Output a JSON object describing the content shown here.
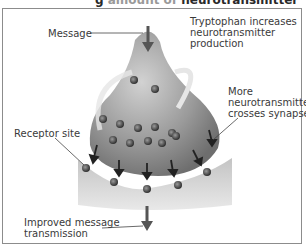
{
  "title": {
    "visible_part": "g",
    "faded_part": " amount of ",
    "bold_part": "neurotransmitter"
  },
  "labels": {
    "message": "Message",
    "tryptophan": [
      "Tryptophan increases",
      "neurotransmitter",
      "production"
    ],
    "more_nt": [
      "More",
      "neurotransmitter",
      "crosses synapse"
    ],
    "receptor": "Receptor site",
    "improved": [
      "Improved message",
      "transmission"
    ]
  },
  "colors": {
    "neuron": "#8e8e8e",
    "neuron_light": "#c9c9c9",
    "receptor_cell": "#cfcfcf",
    "arrow": "#555555",
    "vesicle": "#4a4a4a"
  }
}
